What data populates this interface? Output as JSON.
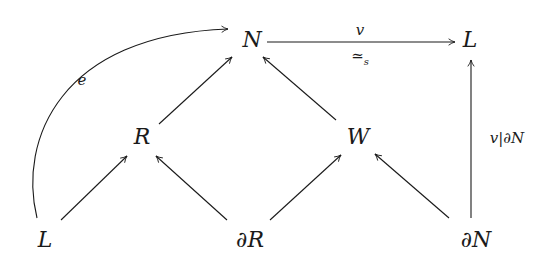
{
  "diagram": {
    "type": "commutative-diagram",
    "nodes": {
      "N": {
        "label": "N"
      },
      "L_top": {
        "label": "L"
      },
      "R": {
        "label": "R"
      },
      "W": {
        "label": "W"
      },
      "L_bottom": {
        "label": "L"
      },
      "dR": {
        "partial": "∂",
        "label": "R"
      },
      "dN": {
        "partial": "∂",
        "label": "N"
      }
    },
    "edges": [
      {
        "from": "N",
        "to": "L_top",
        "label_above": "v",
        "label_below_symbol": "≃",
        "label_below_sub": "s"
      },
      {
        "from": "dN",
        "to": "L_top",
        "label_prefix": "v|",
        "label_partial": "∂",
        "label_suffix": "N"
      },
      {
        "from": "L_bottom",
        "to": "N",
        "curved": true,
        "label": "e"
      },
      {
        "from": "R",
        "to": "N"
      },
      {
        "from": "W",
        "to": "N"
      },
      {
        "from": "L_bottom",
        "to": "R"
      },
      {
        "from": "dR",
        "to": "R"
      },
      {
        "from": "dR",
        "to": "W"
      },
      {
        "from": "dN",
        "to": "W"
      }
    ],
    "colors": {
      "ink": "#1a1a1a",
      "background": "#ffffff"
    }
  }
}
